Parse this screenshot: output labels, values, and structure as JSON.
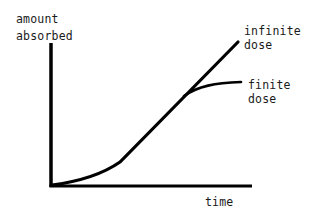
{
  "diagram": {
    "type": "absorption-vs-time",
    "y_axis_label": [
      "amount",
      "absorbed"
    ],
    "x_axis_label": "time",
    "curves": [
      {
        "name": "infinite dose",
        "label_lines": [
          "infinite",
          "dose"
        ],
        "shape": "sigmoid-start then linear rise"
      },
      {
        "name": "finite dose",
        "label_lines": [
          "finite",
          "dose"
        ],
        "shape": "follows infinite then plateaus"
      }
    ],
    "colors": {
      "line": "#000000",
      "text": "#1a1a1a",
      "background": "#ffffff"
    }
  }
}
